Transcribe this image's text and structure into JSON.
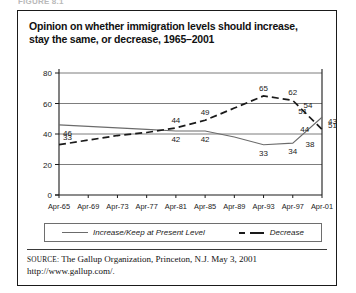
{
  "cut_top_text": "FIGURE 8.1",
  "figure": {
    "title": "Opinion on whether immigration levels should increase, stay the same, or decrease, 1965–2001",
    "source_keyword": "SOURCE:",
    "source_text": " The Gallup Organization, Princeton, N.J. May 3, 2001",
    "source_url": "http://www.gallup.com/."
  },
  "legend": {
    "series_solid_label": "Increase/Keep at Present Level",
    "series_dashed_label": "Decrease"
  },
  "chart_data": {
    "type": "line",
    "title": "Opinion on whether immigration levels should increase, stay the same, or decrease, 1965–2001",
    "xlabel": "",
    "ylabel": "",
    "ylim": [
      0,
      80
    ],
    "yticks": [
      0,
      20,
      40,
      60,
      80
    ],
    "grid": true,
    "legend_position": "bottom",
    "categories": [
      "Apr-65",
      "Apr-69",
      "Apr-73",
      "Apr-77",
      "Apr-81",
      "Apr-85",
      "Apr-89",
      "Apr-93",
      "Apr-97",
      "Apr-01"
    ],
    "series": [
      {
        "name": "Increase/Keep at Present Level",
        "style": "solid",
        "color": "#6b6b6b",
        "values": [
          46,
          45,
          44,
          43,
          42,
          42,
          38,
          33,
          34,
          51
        ],
        "point_labels": [
          "46",
          "",
          "",
          "",
          "42",
          "42",
          "",
          "33",
          "34",
          "51"
        ]
      },
      {
        "name": "Decrease",
        "style": "dashed",
        "color": "#1a1a1a",
        "values": [
          33,
          36,
          39,
          41,
          44,
          49,
          57,
          65,
          62,
          43
        ],
        "point_labels": [
          "33",
          "",
          "",
          "",
          "44",
          "49",
          "",
          "65",
          "62",
          "43"
        ]
      }
    ],
    "extra_labels": [
      {
        "text": "51",
        "series": "Increase/Keep at Present Level",
        "note": "value at Apr-01 shown right of axis"
      },
      {
        "text": "43",
        "series": "Decrease",
        "note": "value at Apr-01 shown right of axis"
      },
      {
        "text": "54",
        "series": "Increase/Keep at Present Level",
        "note": "peak just before Apr-01"
      },
      {
        "text": "44",
        "series": "Decrease",
        "note": "near Apr-99 decline"
      },
      {
        "text": "38",
        "series": "Decrease",
        "note": "low point near Apr-00"
      },
      {
        "text": "51",
        "series": "Increase/Keep at Present Level",
        "note": "rise near Apr-99"
      }
    ]
  }
}
